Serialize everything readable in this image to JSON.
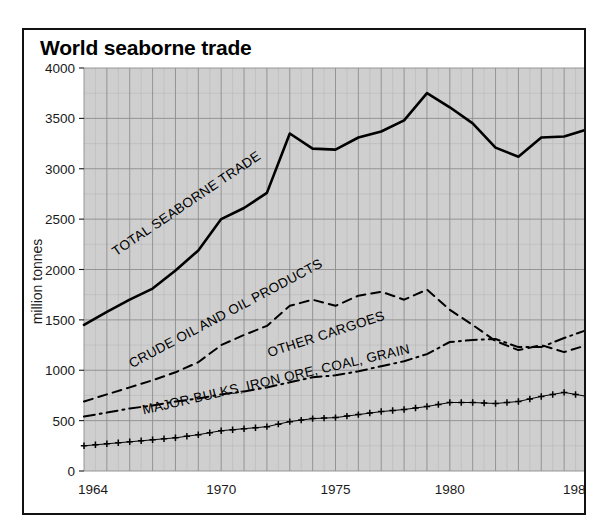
{
  "figure": {
    "title": "World seaborne trade",
    "background_color": "#ffffff",
    "border_color": "#111111",
    "plot_background_color": "#cfcfcf"
  },
  "chart_data": {
    "type": "line",
    "title": "World seaborne trade",
    "xlabel": "",
    "ylabel": "million tonnes",
    "xlim": [
      1964,
      1986
    ],
    "ylim": [
      0,
      4000
    ],
    "ytick_labels": [
      "0",
      "500",
      "1000",
      "1500",
      "2000",
      "2500",
      "3000",
      "3500",
      "4000"
    ],
    "yticks": [
      0,
      500,
      1000,
      1500,
      2000,
      2500,
      3000,
      3500,
      4000
    ],
    "xtick_labels": [
      "1964",
      "1970",
      "1975",
      "1980",
      "1986"
    ],
    "xticks": [
      1964,
      1970,
      1975,
      1980,
      1986
    ],
    "grid": true,
    "grid_major_step_y": 500,
    "grid_minor_step_y": 250,
    "grid_major_step_x": 1,
    "legend": "inline-annotations",
    "x": [
      1964,
      1965,
      1966,
      1967,
      1968,
      1969,
      1970,
      1971,
      1972,
      1973,
      1974,
      1975,
      1976,
      1977,
      1978,
      1979,
      1980,
      1981,
      1982,
      1983,
      1984,
      1985,
      1986
    ],
    "series": [
      {
        "name": "TOTAL SEABORNE TRADE",
        "style": "solid",
        "label_angle": -34,
        "label_x": 1965.4,
        "label_y": 2130,
        "values": [
          1450,
          1580,
          1700,
          1810,
          1990,
          2190,
          2500,
          2610,
          2760,
          3350,
          3200,
          3190,
          3310,
          3370,
          3480,
          3750,
          3610,
          3450,
          3210,
          3120,
          3310,
          3320,
          3390
        ]
      },
      {
        "name": "CRUDE OIL AND OIL PRODUCTS",
        "style": "dashed",
        "label_angle": -28,
        "label_x": 1966.1,
        "label_y": 1020,
        "values": [
          690,
          760,
          830,
          900,
          980,
          1080,
          1250,
          1350,
          1440,
          1640,
          1700,
          1640,
          1740,
          1780,
          1700,
          1800,
          1600,
          1450,
          1290,
          1200,
          1250,
          1180,
          1250
        ]
      },
      {
        "name": "OTHER CARGOES",
        "style": "dashdot",
        "label_angle": -18,
        "label_x": 1972.1,
        "label_y": 1130,
        "values": [
          540,
          580,
          620,
          650,
          690,
          720,
          760,
          790,
          830,
          880,
          930,
          950,
          990,
          1040,
          1090,
          1160,
          1280,
          1300,
          1310,
          1230,
          1230,
          1320,
          1400
        ]
      },
      {
        "name": "MAJOR BULKS, IRON ORE, COAL, GRAIN",
        "style": "plus-markers",
        "label_angle": -13,
        "label_x": 1966.6,
        "label_y": 560,
        "values": [
          250,
          270,
          290,
          310,
          330,
          360,
          400,
          420,
          440,
          490,
          520,
          530,
          560,
          590,
          610,
          640,
          680,
          680,
          670,
          690,
          740,
          780,
          740
        ]
      }
    ]
  }
}
